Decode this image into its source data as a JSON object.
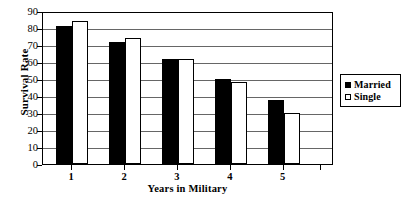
{
  "chart_data": {
    "type": "bar",
    "title": "",
    "xlabel": "Years in Military",
    "ylabel": "Survival Rate",
    "categories": [
      "1",
      "2",
      "3",
      "4",
      "5"
    ],
    "series": [
      {
        "name": "Married",
        "color": "#000000",
        "values": [
          81,
          71.5,
          61.5,
          50,
          37.5
        ]
      },
      {
        "name": "Single",
        "color": "#ffffff",
        "values": [
          84,
          74,
          61.5,
          48,
          30
        ]
      }
    ],
    "ylim": [
      0,
      90
    ],
    "ytick_step": 10,
    "yticks": [
      0,
      10,
      20,
      30,
      40,
      50,
      60,
      70,
      80,
      90
    ],
    "ytick_labels": [
      "0",
      "10",
      "20",
      "30",
      "40",
      "50",
      "60",
      "70",
      "80",
      "90"
    ],
    "grid": true,
    "grid_axis": "y",
    "legend_position": "right",
    "legend_entries": [
      {
        "label": "Married",
        "swatch": "filled"
      },
      {
        "label": "Single",
        "swatch": "hollow"
      }
    ]
  }
}
